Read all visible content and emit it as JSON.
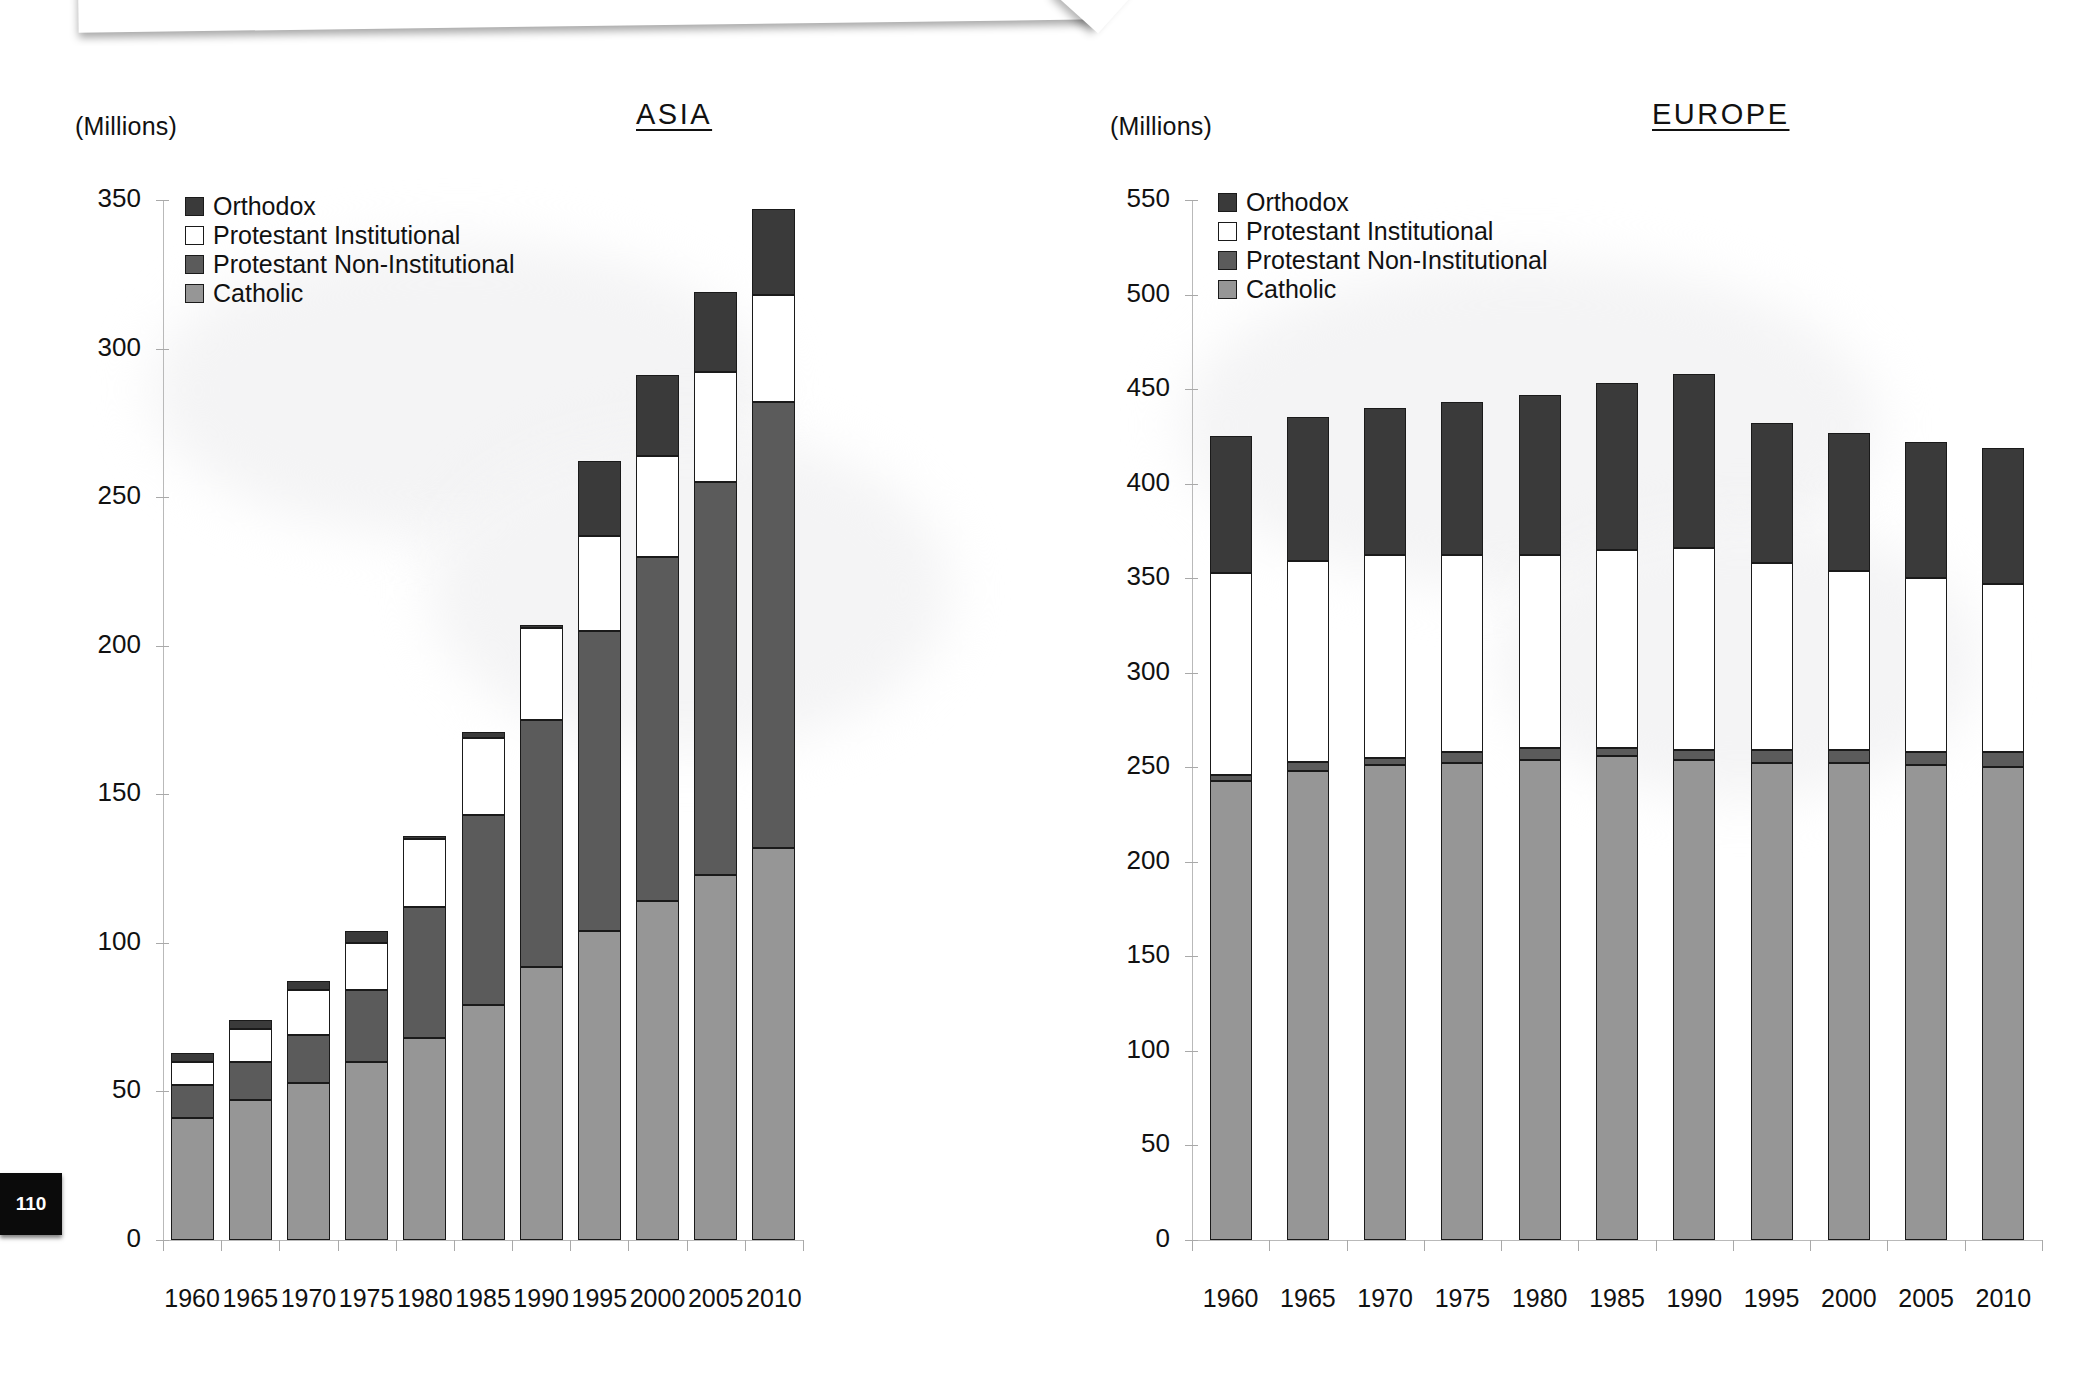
{
  "page": {
    "number": "110"
  },
  "legend": {
    "entries": [
      {
        "label": "Orthodox",
        "color": "#3a3a3a"
      },
      {
        "label": "Protestant Institutional",
        "color": "#ffffff"
      },
      {
        "label": "Protestant Non-Institutional",
        "color": "#5b5b5b"
      },
      {
        "label": "Catholic",
        "color": "#969696"
      }
    ]
  },
  "chart_data": [
    {
      "type": "bar",
      "stacked": true,
      "title": "ASIA",
      "ylabel": "(Millions)",
      "xlabel": "",
      "ylim": [
        0,
        350
      ],
      "ytick_step": 50,
      "yticks": [
        0,
        50,
        100,
        150,
        200,
        250,
        300,
        350
      ],
      "grid": false,
      "legend_position": "top-left",
      "categories": [
        "1960",
        "1965",
        "1970",
        "1975",
        "1980",
        "1985",
        "1990",
        "1995",
        "2000",
        "2005",
        "2010"
      ],
      "series": [
        {
          "name": "Catholic",
          "color": "#969696",
          "values": [
            41,
            47,
            53,
            60,
            68,
            79,
            92,
            104,
            114,
            123,
            132
          ]
        },
        {
          "name": "Protestant Non-Institutional",
          "color": "#5b5b5b",
          "values": [
            11,
            13,
            16,
            24,
            44,
            64,
            83,
            101,
            116,
            132,
            150
          ]
        },
        {
          "name": "Protestant Institutional",
          "color": "#ffffff",
          "values": [
            8,
            11,
            15,
            16,
            23,
            26,
            31,
            32,
            34,
            37,
            36
          ]
        },
        {
          "name": "Orthodox",
          "color": "#3a3a3a",
          "values": [
            3,
            3,
            3,
            4,
            1,
            2,
            1,
            25,
            27,
            27,
            29
          ]
        }
      ],
      "totals": [
        63,
        74,
        87,
        104,
        136,
        171,
        207,
        262,
        291,
        319,
        347
      ]
    },
    {
      "type": "bar",
      "stacked": true,
      "title": "EUROPE",
      "ylabel": "(Millions)",
      "xlabel": "",
      "ylim": [
        0,
        550
      ],
      "ytick_step": 50,
      "yticks": [
        0,
        50,
        100,
        150,
        200,
        250,
        300,
        350,
        400,
        450,
        500,
        550
      ],
      "grid": false,
      "legend_position": "top-left",
      "categories": [
        "1960",
        "1965",
        "1970",
        "1975",
        "1980",
        "1985",
        "1990",
        "1995",
        "2000",
        "2005",
        "2010"
      ],
      "series": [
        {
          "name": "Catholic",
          "color": "#969696",
          "values": [
            243,
            248,
            251,
            252,
            254,
            256,
            254,
            252,
            252,
            251,
            250
          ]
        },
        {
          "name": "Protestant Non-Institutional",
          "color": "#5b5b5b",
          "values": [
            3,
            5,
            4,
            6,
            6,
            4,
            5,
            7,
            7,
            7,
            8
          ]
        },
        {
          "name": "Protestant Institutional",
          "color": "#ffffff",
          "values": [
            107,
            106,
            107,
            104,
            102,
            105,
            107,
            99,
            95,
            92,
            89
          ]
        },
        {
          "name": "Orthodox",
          "color": "#3a3a3a",
          "values": [
            72,
            76,
            78,
            81,
            85,
            88,
            92,
            74,
            73,
            72,
            72
          ]
        }
      ],
      "totals": [
        425,
        435,
        440,
        443,
        447,
        453,
        458,
        432,
        427,
        422,
        419
      ]
    }
  ]
}
